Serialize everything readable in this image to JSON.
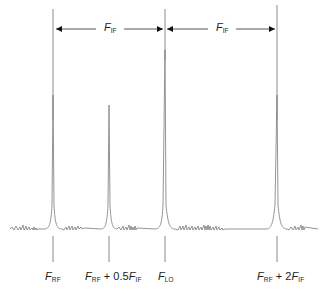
{
  "diagram": {
    "title": "",
    "colors": {
      "line": "#8a8a8a",
      "arrow": "#111111",
      "text": "#222222",
      "background": "#ffffff"
    },
    "dimension_arrows": [
      {
        "label_main": "F",
        "label_sub": "IF",
        "from_x": 53,
        "to_x": 165
      },
      {
        "label_main": "F",
        "label_sub": "IF",
        "from_x": 165,
        "to_x": 277
      }
    ],
    "peaks": [
      {
        "name": "F_RF",
        "x": 53,
        "top_y": 95
      },
      {
        "name": "F_RF + 0.5F_IF",
        "x": 109,
        "top_y": 105
      },
      {
        "name": "F_LO",
        "x": 165,
        "top_y": 50
      },
      {
        "name": "F_RF + 2F_IF",
        "x": 277,
        "top_y": 95
      }
    ],
    "labels": [
      {
        "parts": [
          {
            "m": "F",
            "s": "RF"
          }
        ],
        "text": "F_RF"
      },
      {
        "parts": [
          {
            "m": "F",
            "s": "RF"
          },
          {
            "t": " + 0.5"
          },
          {
            "m": "F",
            "s": "IF"
          }
        ],
        "text": "F_RF + 0.5F_IF"
      },
      {
        "parts": [
          {
            "m": "F",
            "s": "LO"
          }
        ],
        "text": "F_LO"
      },
      {
        "parts": [
          {
            "m": "F",
            "s": "RF"
          },
          {
            "t": " + 2"
          },
          {
            "m": "F",
            "s": "IF"
          }
        ],
        "text": "F_RF + 2F_IF"
      }
    ],
    "label_text": {
      "l0_m": "F",
      "l0_s": "RF",
      "l1_m1": "F",
      "l1_s1": "RF",
      "l1_mid": " + 0.5",
      "l1_m2": "F",
      "l1_s2": "IF",
      "l2_m": "F",
      "l2_s": "LO",
      "l3_m1": "F",
      "l3_s1": "RF",
      "l3_mid": " + 2",
      "l3_m2": "F",
      "l3_s2": "IF",
      "a0_m": "F",
      "a0_s": "IF",
      "a1_m": "F",
      "a1_s": "IF"
    }
  }
}
